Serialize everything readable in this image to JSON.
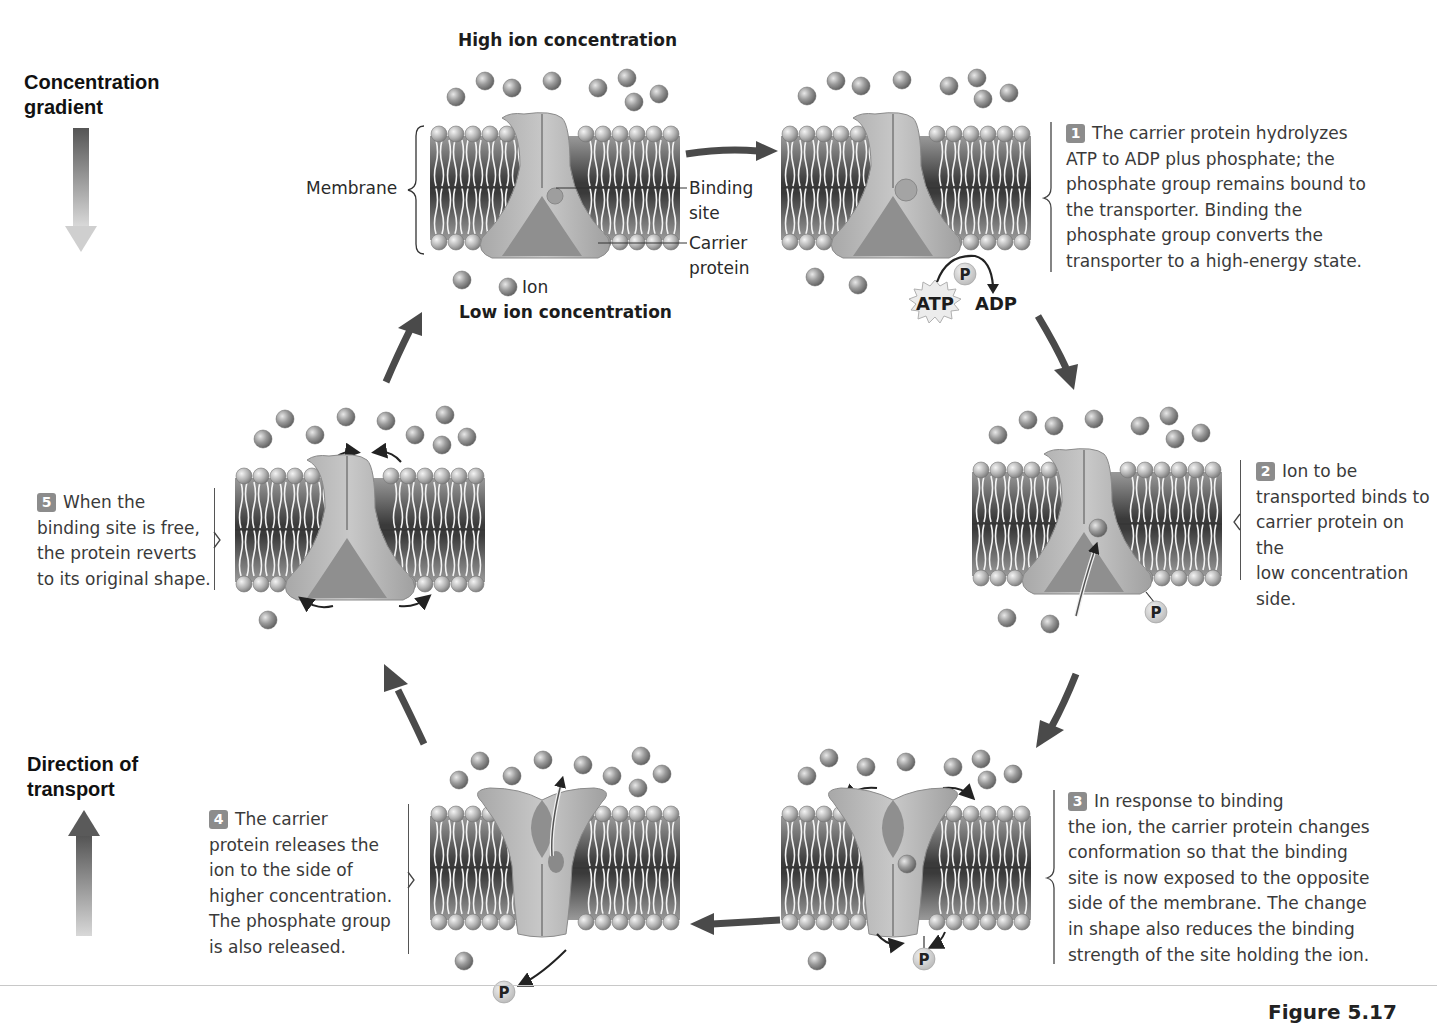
{
  "legend": {
    "concentration_gradient": [
      "Concentration",
      "gradient"
    ],
    "direction_of_transport": [
      "Direction of",
      "transport"
    ]
  },
  "labels": {
    "high_ion": "High ion concentration",
    "low_ion": "Low ion concentration",
    "membrane": "Membrane",
    "binding_site": [
      "Binding",
      "site"
    ],
    "carrier_protein": [
      "Carrier",
      "protein"
    ],
    "ion": "Ion",
    "atp": "ATP",
    "adp": "ADP",
    "phosphate": "P"
  },
  "steps": [
    {
      "num": "1",
      "text_first": "The carrier protein hydrolyzes",
      "lines": [
        "ATP to ADP plus phosphate; the",
        "phosphate group remains bound to",
        "the transporter. Binding the",
        "phosphate group converts the",
        "transporter to a high-energy state."
      ]
    },
    {
      "num": "2",
      "text_first": "Ion to be",
      "lines": [
        "transported binds to",
        "carrier protein on the",
        "low concentration",
        "side."
      ]
    },
    {
      "num": "3",
      "text_first": "In response to binding",
      "lines": [
        "the ion, the carrier protein changes",
        "conformation so that the binding",
        "site is now exposed to the opposite",
        "side of the membrane. The change",
        "in shape also reduces the binding",
        "strength of the site holding the ion."
      ]
    },
    {
      "num": "4",
      "text_first": "The carrier",
      "lines": [
        "protein releases the",
        "ion to the side of",
        "higher concentration.",
        "The phosphate group",
        "is also released."
      ]
    },
    {
      "num": "5",
      "text_first": "When the",
      "lines": [
        "binding site is free,",
        "the protein reverts",
        "to its original shape."
      ]
    }
  ],
  "figure_label": "Figure 5.17",
  "colors": {
    "ion": "#8a8a8a",
    "protein": "#b8b8b8",
    "membrane_dark": "#5a5a5a",
    "arrow": "#4a4a4a",
    "step_badge": "#8c8c8c"
  }
}
